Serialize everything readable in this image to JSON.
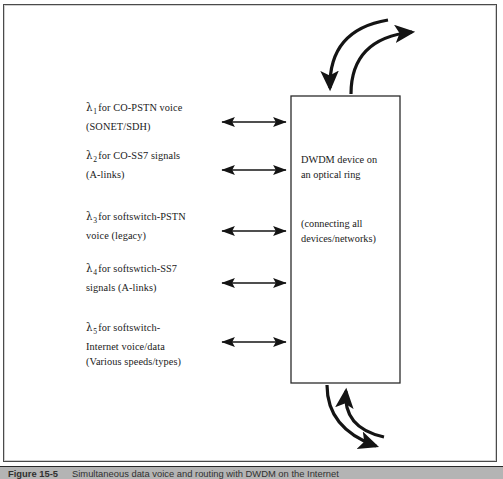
{
  "figure": {
    "caption_label": "Figure 15-5",
    "caption_text": "Simultaneous data voice and routing with DWDM on the Internet",
    "frame_color": "#4a4a4a",
    "ink_color": "#1a1a1a",
    "caption_band_color": "#b4b4b4"
  },
  "wavelength_labels": [
    {
      "symbol": "λ",
      "subscript": "1",
      "line1_rest": "for CO-PSTN voice",
      "line2": "(SONET/SDH)",
      "line3": ""
    },
    {
      "symbol": "λ",
      "subscript": "2",
      "line1_rest": "for CO-SS7 signals",
      "line2": "(A-links)",
      "line3": ""
    },
    {
      "symbol": "λ",
      "subscript": "3",
      "line1_rest": "for softswitch-PSTN",
      "line2": "voice (legacy)",
      "line3": ""
    },
    {
      "symbol": "λ",
      "subscript": "4",
      "line1_rest": "for softswtich-SS7",
      "line2": "signals (A-links)",
      "line3": ""
    },
    {
      "symbol": "λ",
      "subscript": "5",
      "line1_rest": "for softswitch-",
      "line2": "Internet voice/data",
      "line3": "(Various speeds/types)"
    }
  ],
  "device_box": {
    "title_line1": "DWDM device on",
    "title_line2": "an optical ring",
    "note_line1": "(connecting all",
    "note_line2": "devices/networks)"
  },
  "connectors": {
    "bidirectional_count": 5,
    "ring_arrow_top_in": "curved-arrow-into-box-top",
    "ring_arrow_top_out": "curved-arrow-out-of-box-top",
    "ring_arrow_bottom_in": "curved-arrow-into-box-bottom",
    "ring_arrow_bottom_out": "curved-arrow-out-of-box-bottom"
  }
}
